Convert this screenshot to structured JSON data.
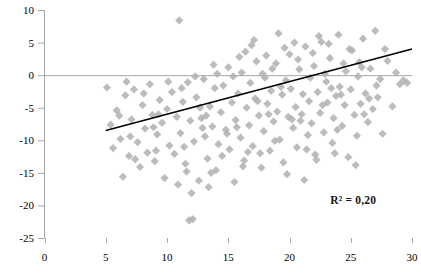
{
  "chart_data": {
    "type": "scatter",
    "title": "",
    "xlabel": "",
    "ylabel": "",
    "xlim": [
      0,
      30
    ],
    "ylim": [
      -25,
      10
    ],
    "xticks": [
      0,
      5,
      10,
      15,
      20,
      25,
      30
    ],
    "yticks": [
      10,
      5,
      0,
      -5,
      -10,
      -15,
      -20,
      -25
    ],
    "xtick_labels": [
      "0",
      "5",
      "10",
      "15",
      "20",
      "25",
      "30"
    ],
    "ytick_labels": [
      "10",
      "5",
      "0",
      "-5",
      "-10",
      "-15",
      "-20",
      "-25"
    ],
    "grid": false,
    "zero_line": true,
    "legend": "none",
    "marker": "diamond",
    "marker_color": "#b0b0b0",
    "marker_size": 7,
    "annotations": [
      {
        "text": "R² = 0,20",
        "x": 25.2,
        "y": -19.2
      }
    ],
    "trendline": {
      "type": "linear",
      "color": "#000000",
      "x_start": 5.0,
      "y_start": -8.5,
      "x_end": 30.0,
      "y_end": 4.0,
      "slope": 0.5,
      "intercept": -11.0,
      "r_squared": 0.2
    },
    "series": [
      {
        "name": "observations",
        "points": [
          [
            5.1,
            -1.9
          ],
          [
            5.4,
            -7.6
          ],
          [
            5.6,
            -11.2
          ],
          [
            5.9,
            -5.4
          ],
          [
            6.2,
            -9.8
          ],
          [
            6.4,
            -15.6
          ],
          [
            6.6,
            -3.1
          ],
          [
            6.9,
            -12.4
          ],
          [
            7.1,
            -6.8
          ],
          [
            7.3,
            -2.2
          ],
          [
            7.6,
            -10.3
          ],
          [
            7.8,
            -14.1
          ],
          [
            8.0,
            -4.6
          ],
          [
            8.2,
            -8.2
          ],
          [
            8.4,
            -11.9
          ],
          [
            8.6,
            -1.4
          ],
          [
            8.8,
            -6.1
          ],
          [
            9.0,
            -13.2
          ],
          [
            9.2,
            -9.1
          ],
          [
            9.4,
            -3.8
          ],
          [
            9.6,
            -7.3
          ],
          [
            9.8,
            -15.8
          ],
          [
            10.0,
            -5.2
          ],
          [
            10.2,
            -10.8
          ],
          [
            10.4,
            -2.6
          ],
          [
            10.6,
            -12.1
          ],
          [
            10.8,
            -6.4
          ],
          [
            11.0,
            8.4
          ],
          [
            11.1,
            -8.9
          ],
          [
            11.3,
            -4.1
          ],
          [
            11.5,
            -13.6
          ],
          [
            11.7,
            -1.1
          ],
          [
            11.8,
            -22.3
          ],
          [
            11.9,
            -7.0
          ],
          [
            12.1,
            -22.1
          ],
          [
            12.2,
            -10.2
          ],
          [
            12.4,
            -3.4
          ],
          [
            12.6,
            -16.2
          ],
          [
            12.8,
            -6.6
          ],
          [
            13.0,
            -0.6
          ],
          [
            13.1,
            -9.4
          ],
          [
            13.3,
            -12.8
          ],
          [
            13.5,
            -4.8
          ],
          [
            13.7,
            -7.9
          ],
          [
            13.9,
            -2.0
          ],
          [
            14.0,
            -14.6
          ],
          [
            14.2,
            -10.6
          ],
          [
            14.4,
            -5.7
          ],
          [
            14.6,
            -1.6
          ],
          [
            14.8,
            -8.4
          ],
          [
            15.0,
            1.2
          ],
          [
            15.1,
            -11.4
          ],
          [
            15.3,
            -4.2
          ],
          [
            15.5,
            -16.4
          ],
          [
            15.6,
            -6.9
          ],
          [
            15.8,
            -2.8
          ],
          [
            16.0,
            -9.6
          ],
          [
            16.1,
            0.4
          ],
          [
            16.3,
            -13.1
          ],
          [
            16.5,
            -5.0
          ],
          [
            16.7,
            -7.7
          ],
          [
            16.8,
            -1.2
          ],
          [
            17.0,
            -10.9
          ],
          [
            17.2,
            -3.6
          ],
          [
            17.3,
            2.1
          ],
          [
            17.5,
            -6.2
          ],
          [
            17.7,
            -14.2
          ],
          [
            17.9,
            -8.6
          ],
          [
            18.0,
            -0.4
          ],
          [
            18.2,
            -4.4
          ],
          [
            18.4,
            -11.6
          ],
          [
            18.5,
            -2.4
          ],
          [
            18.7,
            -7.1
          ],
          [
            18.9,
            1.8
          ],
          [
            19.0,
            -5.6
          ],
          [
            19.2,
            -9.9
          ],
          [
            19.4,
            -3.0
          ],
          [
            19.5,
            -13.4
          ],
          [
            19.7,
            -0.8
          ],
          [
            19.9,
            -6.4
          ],
          [
            20.0,
            3.2
          ],
          [
            20.1,
            -2.1
          ],
          [
            20.3,
            -8.1
          ],
          [
            20.5,
            -4.9
          ],
          [
            20.6,
            -11.1
          ],
          [
            20.8,
            0.9
          ],
          [
            21.0,
            -6.0
          ],
          [
            21.1,
            -2.9
          ],
          [
            21.3,
            4.4
          ],
          [
            21.5,
            -9.2
          ],
          [
            21.6,
            -4.0
          ],
          [
            21.8,
            -7.4
          ],
          [
            22.0,
            1.4
          ],
          [
            22.1,
            -12.2
          ],
          [
            22.3,
            -2.6
          ],
          [
            22.5,
            -5.8
          ],
          [
            22.6,
            5.1
          ],
          [
            22.8,
            -8.8
          ],
          [
            23.0,
            -1.0
          ],
          [
            23.1,
            -4.2
          ],
          [
            23.3,
            2.6
          ],
          [
            23.5,
            -10.4
          ],
          [
            23.6,
            -6.6
          ],
          [
            23.8,
            -3.2
          ],
          [
            24.0,
            6.2
          ],
          [
            24.1,
            -1.8
          ],
          [
            24.3,
            -7.8
          ],
          [
            24.5,
            -4.6
          ],
          [
            24.6,
            0.6
          ],
          [
            24.8,
            -12.6
          ],
          [
            25.0,
            -2.2
          ],
          [
            25.1,
            3.8
          ],
          [
            25.3,
            -6.1
          ],
          [
            25.5,
            -9.3
          ],
          [
            25.6,
            -0.2
          ],
          [
            25.8,
            -4.4
          ],
          [
            26.0,
            5.6
          ],
          [
            26.2,
            -2.8
          ],
          [
            26.4,
            -7.2
          ],
          [
            26.6,
            1.0
          ],
          [
            26.8,
            -5.2
          ],
          [
            27.0,
            6.8
          ],
          [
            27.2,
            -3.4
          ],
          [
            27.4,
            -0.6
          ],
          [
            27.6,
            -9.0
          ],
          [
            28.0,
            2.2
          ],
          [
            28.4,
            -4.8
          ],
          [
            29.0,
            -1.4
          ],
          [
            29.6,
            -1.2
          ],
          [
            12.0,
            -18.1
          ],
          [
            13.4,
            -17.2
          ],
          [
            19.8,
            -15.2
          ],
          [
            21.2,
            -16.1
          ],
          [
            17.6,
            -12.0
          ],
          [
            14.5,
            -12.4
          ],
          [
            10.9,
            -16.8
          ],
          [
            9.1,
            -11.6
          ],
          [
            7.4,
            -12.9
          ],
          [
            6.1,
            -6.2
          ],
          [
            8.1,
            -2.8
          ],
          [
            11.4,
            -11.0
          ],
          [
            12.9,
            -8.1
          ],
          [
            16.6,
            -11.8
          ],
          [
            18.8,
            -10.1
          ],
          [
            20.9,
            -7.0
          ],
          [
            23.9,
            -8.4
          ],
          [
            26.1,
            -6.0
          ],
          [
            15.9,
            2.8
          ],
          [
            18.1,
            3.0
          ],
          [
            19.6,
            4.2
          ],
          [
            21.9,
            3.4
          ],
          [
            23.2,
            4.8
          ],
          [
            24.9,
            4.0
          ],
          [
            20.4,
            5.0
          ],
          [
            22.4,
            6.0
          ],
          [
            25.7,
            2.0
          ],
          [
            16.9,
            4.6
          ],
          [
            14.1,
            0.2
          ],
          [
            13.8,
            1.6
          ],
          [
            12.3,
            -0.2
          ],
          [
            17.1,
            5.4
          ],
          [
            19.1,
            6.4
          ],
          [
            20.7,
            2.4
          ],
          [
            22.9,
            0.2
          ],
          [
            24.4,
            1.8
          ],
          [
            27.8,
            4.0
          ],
          [
            15.4,
            -0.2
          ],
          [
            16.4,
            3.6
          ],
          [
            18.3,
            -6.0
          ],
          [
            19.3,
            -1.8
          ],
          [
            21.7,
            -0.4
          ],
          [
            23.4,
            -2.0
          ],
          [
            12.7,
            -5.0
          ],
          [
            11.2,
            -2.0
          ],
          [
            10.1,
            -1.0
          ],
          [
            9.3,
            -6.0
          ],
          [
            14.9,
            -9.0
          ],
          [
            13.2,
            -6.2
          ],
          [
            17.4,
            -4.0
          ],
          [
            15.7,
            -8.0
          ],
          [
            20.2,
            -6.8
          ],
          [
            22.7,
            -4.6
          ],
          [
            24.2,
            -3.0
          ],
          [
            26.5,
            -3.6
          ],
          [
            11.6,
            -14.8
          ],
          [
            13.6,
            -15.0
          ],
          [
            16.2,
            -14.0
          ],
          [
            22.2,
            -13.0
          ],
          [
            25.4,
            -13.8
          ],
          [
            8.9,
            -8.0
          ],
          [
            7.0,
            -9.4
          ],
          [
            6.7,
            -1.0
          ],
          [
            29.3,
            -0.8
          ],
          [
            28.7,
            0.4
          ],
          [
            27.1,
            -1.6
          ],
          [
            25.9,
            1.2
          ],
          [
            18.6,
            1.0
          ],
          [
            17.8,
            0.2
          ],
          [
            21.4,
            -11.4
          ],
          [
            23.7,
            -12.0
          ]
        ]
      }
    ]
  },
  "axis": {
    "y_axis_name": "y-axis",
    "x_axis_name": "x-axis"
  }
}
